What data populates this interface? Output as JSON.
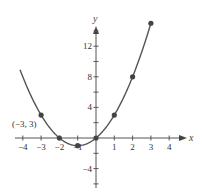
{
  "chart_data": {
    "type": "line",
    "title": "",
    "function": "y = x^2 + 2x",
    "xlabel": "x",
    "ylabel": "y",
    "xlim": [
      -4.5,
      4.8
    ],
    "ylim": [
      -6,
      16
    ],
    "x_ticks": [
      -4,
      -3,
      -2,
      -1,
      1,
      2,
      3,
      4
    ],
    "x_tick_labels": [
      "−4",
      "−3",
      "−2",
      "−1",
      "1",
      "2",
      "3",
      "4"
    ],
    "y_ticks": [
      12,
      8,
      4,
      -4
    ],
    "y_tick_labels": [
      "12",
      "8",
      "4",
      "−4"
    ],
    "grid": false,
    "series": [
      {
        "name": "curve",
        "x": [
          -3,
          -2,
          -1,
          0,
          1,
          2,
          3
        ],
        "y": [
          3,
          0,
          -1,
          0,
          3,
          8,
          15
        ]
      }
    ],
    "annotations": [
      {
        "text": "(−3, 3)",
        "x": -3,
        "y": 3
      }
    ],
    "colors": {
      "curve": "#555555",
      "points": "#444444",
      "axis": "#555555"
    }
  }
}
